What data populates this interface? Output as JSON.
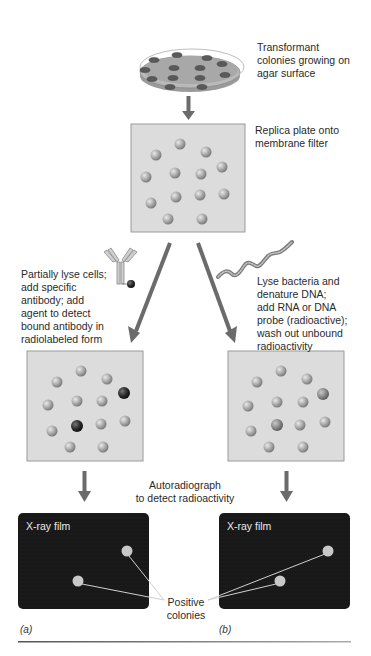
{
  "steps": {
    "petri_dish": {
      "label": "Transformant colonies growing on agar surface",
      "lines": [
        "Transformant",
        "colonies growing on",
        "agar surface"
      ]
    },
    "replica": {
      "label": "Replica plate onto membrane filter",
      "lines": [
        "Replica plate onto",
        "membrane filter"
      ]
    },
    "antibody_path": {
      "lines": [
        "Partially lyse cells;",
        "add specific",
        "antibody; add",
        "agent to detect",
        "bound antibody in",
        "radiolabeled form"
      ]
    },
    "probe_path": {
      "lines": [
        "Lyse bacteria and",
        "denature DNA;",
        "add RNA or DNA",
        "probe (radioactive);",
        "wash out unbound",
        "radioactivity"
      ]
    },
    "autoradiograph": {
      "lines": [
        "Autoradiograph",
        "to detect radioactivity"
      ]
    },
    "film_a": {
      "title": "X-ray film"
    },
    "film_b": {
      "title": "X-ray film"
    },
    "positive": {
      "lines": [
        "Positive",
        "colonies"
      ]
    }
  },
  "panels": {
    "a": "(a)",
    "b": "(b)"
  },
  "icons": {
    "antibody": "antibody-icon",
    "probe": "nucleic-acid-probe-icon",
    "dish": "petri-dish-icon"
  },
  "colors": {
    "arrow": "#6b6b6b",
    "membrane_fill": "#dcdcdc",
    "membrane_border": "#9a9a9a",
    "colony": "#a8a8a8",
    "positive_colony": "#2a2a2a",
    "film": "#161616",
    "film_spot": "#c8c8c8"
  }
}
